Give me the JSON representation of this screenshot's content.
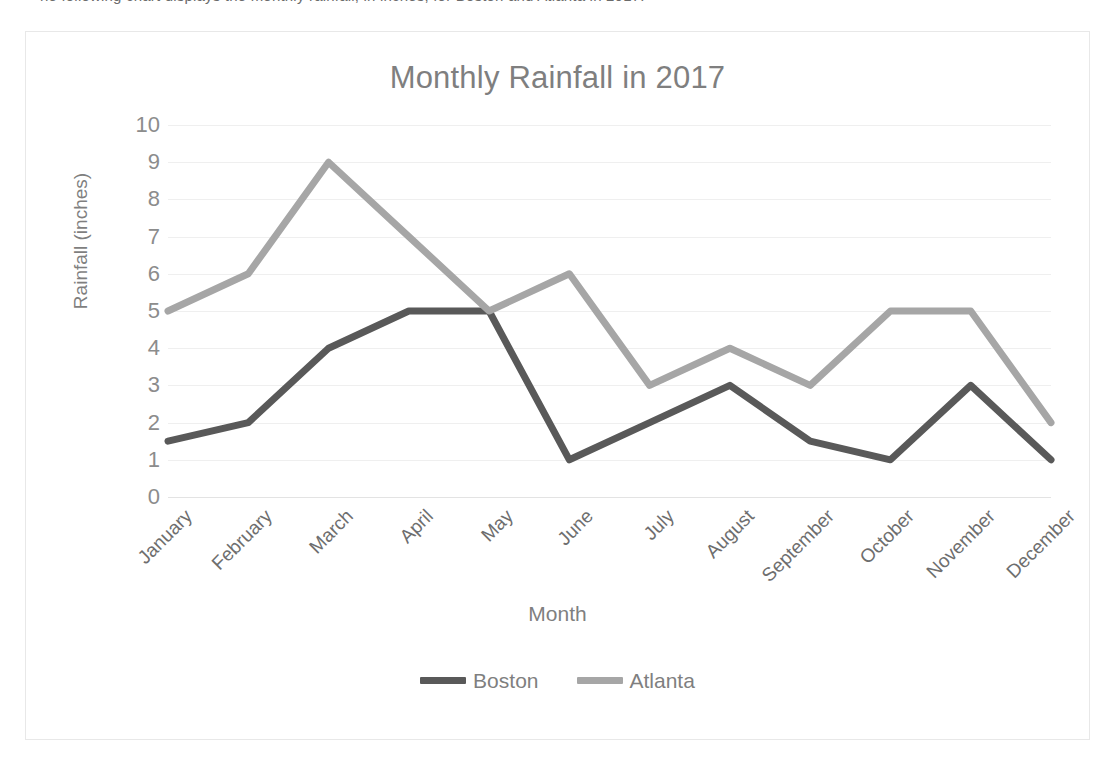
{
  "top_clipped_caption": "ne following chart displays the monthly rainfall, in inches, for Boston and Atlanta in 2017.",
  "chart": {
    "title": "Monthly Rainfall in 2017",
    "xlabel": "Month",
    "ylabel": "Rainfall (inches)"
  },
  "legend": {
    "position": "bottom",
    "items": [
      {
        "label": "Boston",
        "color": "#595959"
      },
      {
        "label": "Atlanta",
        "color": "#a6a6a6"
      }
    ]
  },
  "axis": {
    "y_ticks": [
      "10",
      "9",
      "8",
      "7",
      "6",
      "5",
      "4",
      "3",
      "2",
      "1",
      "0"
    ],
    "x_ticks": [
      "January",
      "February",
      "March",
      "April",
      "May",
      "June",
      "July",
      "August",
      "September",
      "October",
      "November",
      "December"
    ]
  },
  "colors": {
    "boston": "#595959",
    "atlanta": "#a6a6a6",
    "gridline": "#efefef",
    "frame": "#e8e8e8",
    "title_text": "#7f7f7f",
    "tick_text": "#8c8c8c",
    "background": "#ffffff"
  },
  "chart_data": {
    "type": "line",
    "title": "Monthly Rainfall in 2017",
    "xlabel": "Month",
    "ylabel": "Rainfall (inches)",
    "categories": [
      "January",
      "February",
      "March",
      "April",
      "May",
      "June",
      "July",
      "August",
      "September",
      "October",
      "November",
      "December"
    ],
    "series": [
      {
        "name": "Boston",
        "color": "#595959",
        "values": [
          1.5,
          2,
          4,
          5,
          5,
          1,
          2,
          3,
          1.5,
          1,
          3,
          1
        ]
      },
      {
        "name": "Atlanta",
        "color": "#a6a6a6",
        "values": [
          5,
          6,
          9,
          7,
          5,
          6,
          3,
          4,
          3,
          5,
          5,
          2
        ]
      }
    ],
    "ylim": [
      0,
      10
    ],
    "ytick_step": 1,
    "grid": true,
    "markers": false,
    "legend_position": "bottom"
  }
}
